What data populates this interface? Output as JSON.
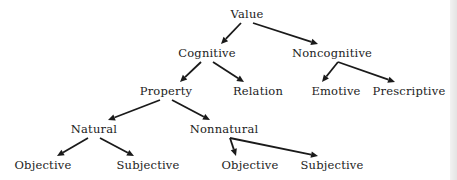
{
  "diagram": {
    "type": "tree",
    "nodes": [
      {
        "id": "value",
        "label": "Value"
      },
      {
        "id": "cognitive",
        "label": "Cognitive"
      },
      {
        "id": "noncognitive",
        "label": "Noncognitive"
      },
      {
        "id": "property",
        "label": "Property"
      },
      {
        "id": "relation",
        "label": "Relation"
      },
      {
        "id": "emotive",
        "label": "Emotive"
      },
      {
        "id": "prescriptive",
        "label": "Prescriptive"
      },
      {
        "id": "natural",
        "label": "Natural"
      },
      {
        "id": "nonnatural",
        "label": "Nonnatural"
      },
      {
        "id": "natural-objective",
        "label": "Objective"
      },
      {
        "id": "natural-subjective",
        "label": "Subjective"
      },
      {
        "id": "nonnatural-objective",
        "label": "Objective"
      },
      {
        "id": "nonnatural-subjective",
        "label": "Subjective"
      }
    ],
    "edges": [
      {
        "from": "value",
        "to": "cognitive"
      },
      {
        "from": "value",
        "to": "noncognitive"
      },
      {
        "from": "cognitive",
        "to": "property"
      },
      {
        "from": "cognitive",
        "to": "relation"
      },
      {
        "from": "noncognitive",
        "to": "emotive"
      },
      {
        "from": "noncognitive",
        "to": "prescriptive"
      },
      {
        "from": "property",
        "to": "natural"
      },
      {
        "from": "property",
        "to": "nonnatural"
      },
      {
        "from": "natural",
        "to": "natural-objective"
      },
      {
        "from": "natural",
        "to": "natural-subjective"
      },
      {
        "from": "nonnatural",
        "to": "nonnatural-objective"
      },
      {
        "from": "nonnatural",
        "to": "nonnatural-subjective"
      }
    ],
    "colors": {
      "ink": "#1a1a1a",
      "background": "#ffffff"
    }
  }
}
